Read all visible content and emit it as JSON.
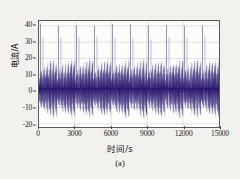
{
  "chart_data": {
    "type": "line",
    "title": "",
    "xlabel": "时间/s",
    "ylabel": "电流/A",
    "caption": "(a)",
    "xlim": [
      0,
      15000
    ],
    "ylim": [
      -22,
      43
    ],
    "grid": true,
    "legend": null,
    "series_color": "#2b1a6e",
    "spike_color": "#6b5aa8",
    "background_color": "#f3f1ee",
    "plot_background_color": "#fdfcfa",
    "axis_color": "#5a5a5a",
    "x_ticks": [
      {
        "value": 0,
        "label": "0"
      },
      {
        "value": 3000,
        "label": "3000"
      },
      {
        "value": 6000,
        "label": "6000"
      },
      {
        "value": 9000,
        "label": "9000"
      },
      {
        "value": 12000,
        "label": "12000"
      },
      {
        "value": 15000,
        "label": "15000"
      }
    ],
    "y_ticks": [
      {
        "value": 40,
        "label": "40"
      },
      {
        "value": 30,
        "label": "30"
      },
      {
        "value": 20,
        "label": "20"
      },
      {
        "value": 10,
        "label": "10"
      },
      {
        "value": 0,
        "label": "0"
      },
      {
        "value": -10,
        "label": "-10"
      },
      {
        "value": -20,
        "label": "-20"
      }
    ],
    "signal": {
      "cycle_count": 10,
      "cycle_period_s": 1500,
      "band_upper_a": 20,
      "band_lower_a": -17,
      "mean_a": 1.5,
      "spike_peak_a": 41,
      "spikes_per_cycle": 2,
      "spike_offsets_s": [
        120,
        330
      ],
      "spike_peaks_a": [
        41,
        33
      ],
      "envelope_segments_per_cycle": 6,
      "envelope_upper_a": [
        14,
        16.5,
        18,
        19,
        20,
        19.5
      ],
      "envelope_lower_a": [
        -11,
        -13,
        -14.5,
        -15.5,
        -17,
        -16
      ]
    }
  }
}
